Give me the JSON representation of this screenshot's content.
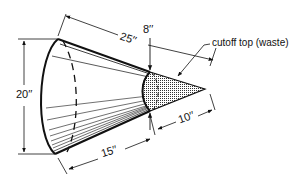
{
  "diagram": {
    "type": "truncated-cone-dimension-drawing",
    "colors": {
      "ink": "#111111",
      "background": "#ffffff",
      "waste_fill": "#9a9a9a"
    },
    "dimensions": {
      "slant_total": "25′′",
      "top_diameter": "8′′",
      "base_diameter": "20′′",
      "slant_frustum": "15′′",
      "slant_waste": "10′′"
    },
    "annotations": {
      "waste_label": "cutoff top (waste)"
    }
  }
}
